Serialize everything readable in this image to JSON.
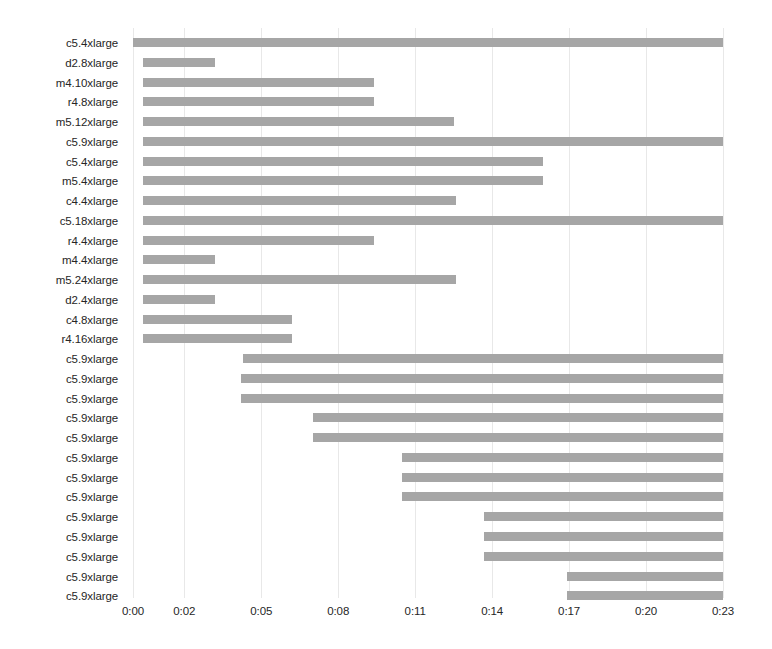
{
  "chart_data": {
    "type": "bar",
    "subtype": "gantt-horizontal-bar",
    "title": "",
    "xlabel": "",
    "ylabel": "",
    "grid": true,
    "legend": "none",
    "x_axis": {
      "tick_labels": [
        "0:00",
        "0:02",
        "0:05",
        "0:08",
        "0:11",
        "0:14",
        "0:17",
        "0:20",
        "0:23"
      ],
      "tick_values_minutes": [
        0,
        2,
        5,
        8,
        11,
        14,
        17,
        20,
        23
      ],
      "xlim_minutes": [
        0,
        23
      ],
      "units": "mm:ss displayed as h:mm"
    },
    "categories": [
      "c5.4xlarge",
      "d2.8xlarge",
      "m4.10xlarge",
      "r4.8xlarge",
      "m5.12xlarge",
      "c5.9xlarge",
      "c5.4xlarge",
      "m5.4xlarge",
      "c4.4xlarge",
      "c5.18xlarge",
      "r4.4xlarge",
      "m4.4xlarge",
      "m5.24xlarge",
      "d2.4xlarge",
      "c4.8xlarge",
      "r4.16xlarge",
      "c5.9xlarge",
      "c5.9xlarge",
      "c5.9xlarge",
      "c5.9xlarge",
      "c5.9xlarge",
      "c5.9xlarge",
      "c5.9xlarge",
      "c5.9xlarge",
      "c5.9xlarge",
      "c5.9xlarge",
      "c5.9xlarge",
      "c5.9xlarge",
      "c5.9xlarge"
    ],
    "bars": [
      {
        "label": "c5.4xlarge",
        "start": 0.0,
        "end": 23.0
      },
      {
        "label": "d2.8xlarge",
        "start": 0.4,
        "end": 3.2
      },
      {
        "label": "m4.10xlarge",
        "start": 0.4,
        "end": 9.4
      },
      {
        "label": "r4.8xlarge",
        "start": 0.4,
        "end": 9.4
      },
      {
        "label": "m5.12xlarge",
        "start": 0.4,
        "end": 12.5
      },
      {
        "label": "c5.9xlarge",
        "start": 0.4,
        "end": 23.0
      },
      {
        "label": "c5.4xlarge",
        "start": 0.4,
        "end": 16.0
      },
      {
        "label": "m5.4xlarge",
        "start": 0.4,
        "end": 16.0
      },
      {
        "label": "c4.4xlarge",
        "start": 0.4,
        "end": 12.6
      },
      {
        "label": "c5.18xlarge",
        "start": 0.4,
        "end": 23.0
      },
      {
        "label": "r4.4xlarge",
        "start": 0.4,
        "end": 9.4
      },
      {
        "label": "m4.4xlarge",
        "start": 0.4,
        "end": 3.2
      },
      {
        "label": "m5.24xlarge",
        "start": 0.4,
        "end": 12.6
      },
      {
        "label": "d2.4xlarge",
        "start": 0.4,
        "end": 3.2
      },
      {
        "label": "c4.8xlarge",
        "start": 0.4,
        "end": 6.2
      },
      {
        "label": "r4.16xlarge",
        "start": 0.4,
        "end": 6.2
      },
      {
        "label": "c5.9xlarge",
        "start": 4.3,
        "end": 23.0
      },
      {
        "label": "c5.9xlarge",
        "start": 4.2,
        "end": 23.0
      },
      {
        "label": "c5.9xlarge",
        "start": 4.2,
        "end": 23.0
      },
      {
        "label": "c5.9xlarge",
        "start": 7.0,
        "end": 23.0
      },
      {
        "label": "c5.9xlarge",
        "start": 7.0,
        "end": 23.0
      },
      {
        "label": "c5.9xlarge",
        "start": 10.5,
        "end": 23.0
      },
      {
        "label": "c5.9xlarge",
        "start": 10.5,
        "end": 23.0
      },
      {
        "label": "c5.9xlarge",
        "start": 10.5,
        "end": 23.0
      },
      {
        "label": "c5.9xlarge",
        "start": 13.7,
        "end": 23.0
      },
      {
        "label": "c5.9xlarge",
        "start": 13.7,
        "end": 23.0
      },
      {
        "label": "c5.9xlarge",
        "start": 13.7,
        "end": 23.0
      },
      {
        "label": "c5.9xlarge",
        "start": 16.9,
        "end": 23.0
      },
      {
        "label": "c5.9xlarge",
        "start": 16.9,
        "end": 23.0
      }
    ],
    "colors": {
      "bar": "#a6a6a6",
      "gridline": "#e8e8e8",
      "text": "#262626",
      "background": "#ffffff"
    }
  }
}
